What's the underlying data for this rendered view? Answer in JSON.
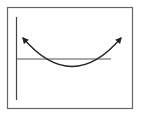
{
  "diagram": {
    "type": "parabola-sketch",
    "colors": {
      "frame": "#555555",
      "axis": "#444444",
      "line": "#555555",
      "curve": "#222222",
      "background": "#ffffff"
    },
    "elements": {
      "frame": "rectangle-border",
      "vertical_axis": "y-axis",
      "horizontal_line": "x-axis-line",
      "curve": "parabola-opening-up",
      "left_arrow": "arrowhead-up-left",
      "right_arrow": "arrowhead-up-right"
    }
  }
}
